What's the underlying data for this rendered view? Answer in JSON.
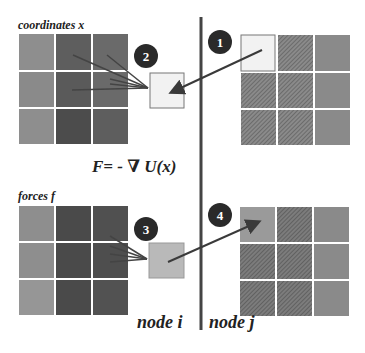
{
  "labels": {
    "coordinates": "coordinates x",
    "forces": "forces f",
    "equation": "F= - ∇ U(x)",
    "node_i": "node i",
    "node_j": "node j"
  },
  "steps": [
    "1",
    "2",
    "3",
    "4"
  ],
  "colors": {
    "divider": "#444444",
    "arrow": "#3a3a3a",
    "badge": "#2a2a2a",
    "light_cell": "#f2f2f2",
    "forces_small_cell": "#b9b9b9",
    "grid_mid": "#8c8c8c",
    "grid_dark": "#5a5a5a",
    "grid_darker": "#4a4a4a",
    "grid_hatch": "#7d7d7d"
  }
}
